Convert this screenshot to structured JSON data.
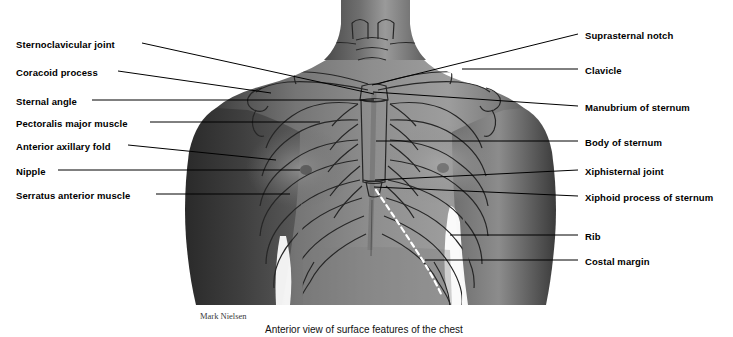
{
  "figure": {
    "title": "Anterior view of surface features of the chest",
    "credit": "Mark Nielsen",
    "image_description": "Grayscale photograph of a male torso, anterior view, with the rib cage, clavicles, sternum and costal margin drawn as dark outlines over the skin surface",
    "colors": {
      "background": "#ffffff",
      "leader_line": "#000000",
      "label_text": "#000000",
      "caption_text": "#111111",
      "credit_text": "#3a3a3a",
      "costal_margin_dash": "#ffffff",
      "skin_midtone": "#8a8a8a",
      "skin_shadow": "#3d3d3d",
      "skin_highlight": "#c9c9c9",
      "bone_outline": "#2b2b2b"
    }
  },
  "labels_left": [
    {
      "text": "Sternoclavicular joint",
      "x": 16,
      "y": 39,
      "line": [
        142,
        43,
        374,
        94
      ]
    },
    {
      "text": "Coracoid process",
      "x": 16,
      "y": 67,
      "line": [
        118,
        71,
        271,
        93
      ]
    },
    {
      "text": "Sternal angle",
      "x": 16,
      "y": 96,
      "line": [
        92,
        100,
        374,
        100
      ]
    },
    {
      "text": "Pectoralis major muscle",
      "x": 16,
      "y": 118,
      "line": [
        150,
        122,
        320,
        122
      ]
    },
    {
      "text": "Anterior axillary fold",
      "x": 16,
      "y": 141,
      "line": [
        128,
        145,
        276,
        160
      ]
    },
    {
      "text": "Nipple",
      "x": 16,
      "y": 166,
      "line": [
        58,
        170,
        300,
        170
      ]
    },
    {
      "text": "Serratus anterior muscle",
      "x": 16,
      "y": 190,
      "line": [
        156,
        194,
        290,
        194
      ]
    }
  ],
  "labels_right": [
    {
      "text": "Suprasternal notch",
      "x": 585,
      "y": 30,
      "line": [
        578,
        34,
        372,
        85
      ]
    },
    {
      "text": "Clavicle",
      "x": 585,
      "y": 65,
      "line": [
        578,
        69,
        462,
        69
      ]
    },
    {
      "text": "Manubrium of sternum",
      "x": 585,
      "y": 102,
      "line": [
        578,
        106,
        373,
        92
      ]
    },
    {
      "text": "Body of sternum",
      "x": 585,
      "y": 137,
      "line": [
        578,
        141,
        376,
        141
      ]
    },
    {
      "text": "Xiphisternal joint",
      "x": 585,
      "y": 166,
      "line": [
        578,
        170,
        375,
        180
      ]
    },
    {
      "text": "Xiphoid process of sternum",
      "x": 585,
      "y": 192,
      "line": [
        578,
        196,
        374,
        187
      ]
    },
    {
      "text": "Rib",
      "x": 585,
      "y": 231,
      "line": [
        578,
        235,
        450,
        235
      ]
    },
    {
      "text": "Costal margin",
      "x": 585,
      "y": 256,
      "line": [
        578,
        260,
        425,
        260
      ]
    }
  ]
}
